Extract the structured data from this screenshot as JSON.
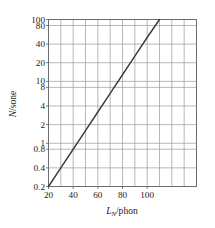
{
  "chart_data": {
    "type": "line",
    "title": "",
    "xlabel": "L_N/phon",
    "xlabel_main": "L",
    "xlabel_sub": "N",
    "xlabel_rest": "/phon",
    "ylabel": "N/sone",
    "ylabel_main": "N",
    "ylabel_rest": "/sone",
    "xscale": "linear",
    "yscale": "log",
    "xlim": [
      20,
      140
    ],
    "ylim": [
      0.2,
      100
    ],
    "grid": true,
    "legend": null,
    "xticks": [
      20,
      40,
      60,
      80,
      100
    ],
    "xtick_labels": [
      "20",
      "40",
      "60",
      "80",
      "100"
    ],
    "xgridlines": [
      20,
      30,
      40,
      50,
      60,
      70,
      80,
      90,
      100,
      110,
      120,
      130,
      140
    ],
    "yticks": [
      0.2,
      0.4,
      0.8,
      1,
      2,
      4,
      8,
      10,
      20,
      40,
      80,
      100
    ],
    "ytick_labels": [
      "0.2",
      "0.4",
      "0.8",
      "1",
      "2",
      "4",
      "8",
      "10",
      "20",
      "40",
      "80",
      "100"
    ],
    "ygridlines": [
      0.2,
      0.4,
      0.8,
      1,
      2,
      4,
      8,
      10,
      20,
      40,
      80,
      100
    ],
    "series": [
      {
        "name": "loudness",
        "x": [
          20,
          30,
          40,
          50,
          60,
          70,
          80,
          90,
          100,
          110
        ],
        "y": [
          0.2,
          0.4,
          0.8,
          1.6,
          3.2,
          6.4,
          12.8,
          25.6,
          51.2,
          100
        ]
      }
    ],
    "line_color": "#3a3a3a",
    "grid_color": "#9a9a9a",
    "frame_color": "#6e6e6e",
    "background_color": "#ffffff"
  },
  "axes": {
    "x_axis_name": "x-axis",
    "y_axis_name": "y-axis"
  }
}
